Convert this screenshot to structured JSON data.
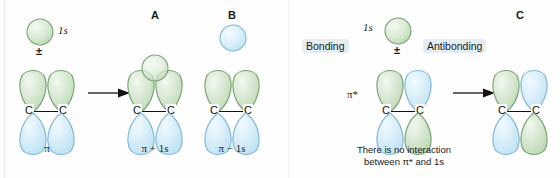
{
  "figure": {
    "title_visible": false,
    "colors": {
      "green_fill": "#cfe3ca",
      "green_fill_light": "#e9f3e6",
      "green_stroke": "#6f9a69",
      "blue_fill": "#cfe8f5",
      "blue_fill_light": "#e9f6fc",
      "blue_stroke": "#79b4d4",
      "bond_black": "#111111",
      "highlight_box": "#e6edf2",
      "background": "#fefefe"
    }
  },
  "left_panel": {
    "reactant": {
      "s_orbital_label": "1s",
      "s_orbital_phase": "green",
      "combination_symbol": "±",
      "orbital_label": "π",
      "lobes": {
        "top_left": "green",
        "top_right": "green",
        "bottom_left": "blue",
        "bottom_right": "blue"
      },
      "atoms": [
        "C",
        "C"
      ]
    },
    "arrow": "→",
    "products": [
      {
        "tag": "A",
        "caption": "π + 1s",
        "s_orbital_phase": "green",
        "s_orbital_overlapping": true,
        "lobes": {
          "top_left": "green",
          "top_right": "green",
          "bottom_left": "blue",
          "bottom_right": "blue"
        },
        "atoms": [
          "C",
          "C"
        ]
      },
      {
        "tag": "B",
        "caption": "π − 1s",
        "s_orbital_phase": "blue",
        "s_orbital_overlapping": false,
        "lobes": {
          "top_left": "green",
          "top_right": "green",
          "bottom_left": "blue",
          "bottom_right": "blue"
        },
        "atoms": [
          "C",
          "C"
        ]
      }
    ]
  },
  "right_panel": {
    "reactant": {
      "s_orbital_label": "1s",
      "s_orbital_phase": "green",
      "combination_symbol": "±",
      "orbital_label": "π*",
      "lobes": {
        "top_left": "green",
        "top_right": "blue",
        "bottom_left": "blue",
        "bottom_right": "green"
      },
      "atoms": [
        "C",
        "C"
      ]
    },
    "annotations": {
      "bonding": "Bonding",
      "antibonding": "Antibonding"
    },
    "caption_lines": [
      "There is no interaction",
      "between π* and 1s"
    ],
    "arrow": "→",
    "product": {
      "tag": "C",
      "lobes": {
        "top_left": "green",
        "top_right": "blue",
        "bottom_left": "blue",
        "bottom_right": "green"
      },
      "atoms": [
        "C",
        "C"
      ]
    }
  }
}
